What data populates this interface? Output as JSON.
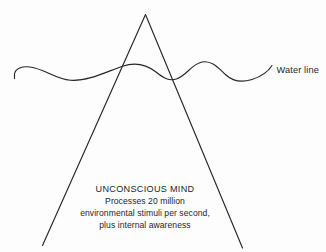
{
  "figure": {
    "background_color": "#fdfdfd",
    "ink_color": "#27262b",
    "water_line_label": "Water line",
    "caption": {
      "heading": "UNCONSCIOUS MIND",
      "line_1": "Processes 20 million",
      "line_2": "environmental stimuli per second,",
      "line_3": "plus internal awareness"
    }
  }
}
